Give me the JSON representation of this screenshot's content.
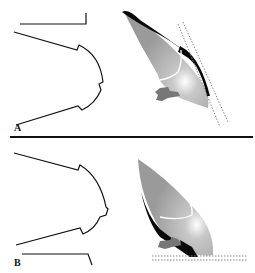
{
  "figure": {
    "panels": [
      {
        "id": "A",
        "label": "A"
      },
      {
        "id": "B",
        "label": "B"
      }
    ]
  },
  "colors": {
    "outline": "#111111",
    "wing_fill_light": "#d8d8d8",
    "wing_fill_mid": "#a8a8a8",
    "wing_fill_dark": "#8c8c8c",
    "edge_black": "#0a0a0a",
    "body_grey": "#777777",
    "dotted_line": "#888888"
  }
}
